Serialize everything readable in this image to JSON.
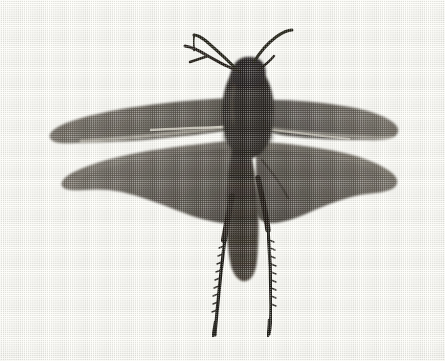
{
  "image": {
    "kind": "halftone-photograph",
    "subject": "grasshopper-specimen-dorsal-wings-spread",
    "alt_text": "Black and white halftone photograph of a grasshopper specimen seen from above with both pairs of wings spread outward",
    "width_px": 445,
    "height_px": 361,
    "orientation": "landscape",
    "background_color": "#fdfdf8",
    "paper_tint": "#f6f4e9",
    "ink_color": "#2b2722",
    "wing_tone": "#6d685f",
    "wing_tone_dark": "#5a564e",
    "body_tone": "#332e28",
    "highlight_tone": "#d8d4c6",
    "border": "none",
    "caption": "",
    "labels": []
  },
  "specimen": {
    "common_name": "grasshopper",
    "view": "dorsal",
    "parts": [
      {
        "name": "left-forewing",
        "tone": "#6f6a61"
      },
      {
        "name": "right-forewing",
        "tone": "#6b665d"
      },
      {
        "name": "left-hindwing",
        "tone": "#656057"
      },
      {
        "name": "right-hindwing",
        "tone": "#625d54"
      },
      {
        "name": "head",
        "tone": "#2e2923"
      },
      {
        "name": "pronotum-thorax",
        "tone": "#2a251f"
      },
      {
        "name": "abdomen",
        "tone": "#3a342c"
      },
      {
        "name": "left-antenna",
        "tone": "#241f1a"
      },
      {
        "name": "right-antenna",
        "tone": "#241f1a"
      },
      {
        "name": "foreleg",
        "tone": "#241f1a"
      },
      {
        "name": "left-hind-tibia",
        "tone": "#1f1b16"
      },
      {
        "name": "right-hind-tibia",
        "tone": "#1f1b16"
      }
    ],
    "measurements": {
      "wingspan_px": 352,
      "body_length_px": 262,
      "figure_left_px": 48,
      "figure_right_px": 400,
      "figure_top_px": 28,
      "figure_bottom_px": 336
    }
  }
}
